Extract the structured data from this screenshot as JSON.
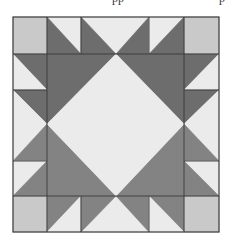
{
  "caption_fragments": [
    {
      "text": "pp",
      "x": 112
    },
    {
      "text": "p",
      "x": 219
    }
  ],
  "colors": {
    "background": "#ffffff",
    "light": "#ebebeb",
    "corner": "#c9c9c9",
    "dark": "#6d6d6d",
    "medium": "#838383",
    "outline": "#3a3a3a"
  },
  "block": {
    "x0": 13,
    "y0": 17,
    "x1": 219,
    "y1": 232,
    "grid_x": [
      13,
      47,
      81,
      116,
      149,
      184,
      219
    ],
    "grid_y": [
      17,
      54,
      90,
      124,
      161,
      196,
      232
    ]
  },
  "pieces": [
    {
      "name": "corner-top-left",
      "fill": "corner",
      "points": "13,17 47,17 47,54 13,54"
    },
    {
      "name": "corner-top-right",
      "fill": "corner",
      "points": "184,17 219,17 219,54 184,54"
    },
    {
      "name": "corner-bottom-left",
      "fill": "corner",
      "points": "13,196 47,196 47,232 13,232"
    },
    {
      "name": "corner-bottom-right",
      "fill": "corner",
      "points": "184,196 219,196 219,232 184,232"
    },
    {
      "name": "top-cell1-light",
      "fill": "light",
      "points": "47,17 81,17 81,54"
    },
    {
      "name": "top-cell1-dark",
      "fill": "dark",
      "points": "47,17 81,54 47,54"
    },
    {
      "name": "top-mid-light",
      "fill": "light",
      "points": "81,17 149,17 116,54"
    },
    {
      "name": "top-mid-dark-left",
      "fill": "dark",
      "points": "81,17 116,54 81,54"
    },
    {
      "name": "top-mid-dark-right",
      "fill": "dark",
      "points": "149,17 149,54 116,54"
    },
    {
      "name": "top-cell4-light",
      "fill": "light",
      "points": "149,17 184,17 149,54"
    },
    {
      "name": "top-cell4-dark",
      "fill": "dark",
      "points": "184,17 184,54 149,54"
    },
    {
      "name": "left-cell1-dark",
      "fill": "dark",
      "points": "13,54 47,54 47,90"
    },
    {
      "name": "left-cell1-light",
      "fill": "light",
      "points": "13,54 47,90 13,90"
    },
    {
      "name": "left-mid-dark",
      "fill": "dark",
      "points": "13,90 47,90 47,124"
    },
    {
      "name": "left-mid-light",
      "fill": "light",
      "points": "13,90 47,124 13,161"
    },
    {
      "name": "left-mid-medium",
      "fill": "medium",
      "points": "47,124 47,161 13,161"
    },
    {
      "name": "left-cell4-light",
      "fill": "light",
      "points": "13,161 47,161 13,196"
    },
    {
      "name": "left-cell4-medium",
      "fill": "medium",
      "points": "47,161 47,196 13,196"
    },
    {
      "name": "right-cell1-dark",
      "fill": "dark",
      "points": "184,54 219,54 184,90"
    },
    {
      "name": "right-cell1-light",
      "fill": "light",
      "points": "219,54 219,90 184,90"
    },
    {
      "name": "right-mid-dark",
      "fill": "dark",
      "points": "184,90 219,90 184,124"
    },
    {
      "name": "right-mid-light",
      "fill": "light",
      "points": "219,90 219,161 184,124"
    },
    {
      "name": "right-mid-medium",
      "fill": "medium",
      "points": "184,124 219,161 184,161"
    },
    {
      "name": "right-cell4-light",
      "fill": "light",
      "points": "184,161 219,161 219,196"
    },
    {
      "name": "right-cell4-medium",
      "fill": "medium",
      "points": "184,161 219,196 184,196"
    },
    {
      "name": "bottom-cell1-medium",
      "fill": "medium",
      "points": "47,196 81,196 47,232"
    },
    {
      "name": "bottom-cell1-light",
      "fill": "light",
      "points": "81,196 81,232 47,232"
    },
    {
      "name": "bottom-mid-light",
      "fill": "light",
      "points": "116,196 149,232 81,232"
    },
    {
      "name": "bottom-mid-medium-left",
      "fill": "medium",
      "points": "81,196 116,196 81,232"
    },
    {
      "name": "bottom-mid-medium-right",
      "fill": "medium",
      "points": "116,196 149,196 149,232"
    },
    {
      "name": "bottom-cell4-medium",
      "fill": "medium",
      "points": "149,196 184,196 184,232"
    },
    {
      "name": "bottom-cell4-light",
      "fill": "light",
      "points": "149,196 184,232 149,232"
    },
    {
      "name": "center-dark-top-left",
      "fill": "dark",
      "points": "47,54 116,54 47,124"
    },
    {
      "name": "center-dark-top-right",
      "fill": "dark",
      "points": "116,54 184,54 184,124"
    },
    {
      "name": "center-medium-bottom-left",
      "fill": "medium",
      "points": "47,124 116,196 47,196"
    },
    {
      "name": "center-medium-bottom-right",
      "fill": "medium",
      "points": "184,124 184,196 116,196"
    },
    {
      "name": "center-diamond",
      "fill": "light",
      "points": "116,54 184,124 116,196 47,124"
    }
  ],
  "grid_lines": [
    {
      "name": "grid-line-h-top",
      "x1": 13,
      "y1": 54,
      "x2": 219,
      "y2": 54
    },
    {
      "name": "grid-line-h-bottom",
      "x1": 13,
      "y1": 196,
      "x2": 219,
      "y2": 196
    },
    {
      "name": "grid-line-v-left",
      "x1": 47,
      "y1": 17,
      "x2": 47,
      "y2": 232
    },
    {
      "name": "grid-line-v-right",
      "x1": 184,
      "y1": 17,
      "x2": 184,
      "y2": 232
    },
    {
      "name": "grid-line-top-81",
      "x1": 81,
      "y1": 17,
      "x2": 81,
      "y2": 54
    },
    {
      "name": "grid-line-top-149",
      "x1": 149,
      "y1": 17,
      "x2": 149,
      "y2": 54
    },
    {
      "name": "grid-line-bottom-81",
      "x1": 81,
      "y1": 196,
      "x2": 81,
      "y2": 232
    },
    {
      "name": "grid-line-bottom-149",
      "x1": 149,
      "y1": 196,
      "x2": 149,
      "y2": 232
    },
    {
      "name": "grid-line-left-90",
      "x1": 13,
      "y1": 90,
      "x2": 47,
      "y2": 90
    },
    {
      "name": "grid-line-left-161",
      "x1": 13,
      "y1": 161,
      "x2": 47,
      "y2": 161
    },
    {
      "name": "grid-line-right-90",
      "x1": 184,
      "y1": 90,
      "x2": 219,
      "y2": 90
    },
    {
      "name": "grid-line-right-161",
      "x1": 184,
      "y1": 161,
      "x2": 219,
      "y2": 161
    }
  ]
}
